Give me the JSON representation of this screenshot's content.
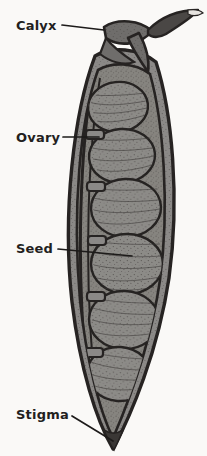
{
  "figure": {
    "background_color": "#faf9f7",
    "width": 207,
    "height": 456
  },
  "palette": {
    "background": "#faf9f7",
    "outline": "#262322",
    "tissue_mid": "#8b8987",
    "tissue_dark": "#6f6d6b",
    "tissue_light": "#a2a09e",
    "stipple": "#3b3836",
    "label_text": "#231f1e",
    "leader_line": "#1d1b1a"
  },
  "labels": [
    {
      "id": "calyx",
      "text": "Calyx",
      "text_x": 16,
      "text_y": 30,
      "leader": "M 62 25 L 104 30",
      "target_part": "calyx-sepals"
    },
    {
      "id": "ovary",
      "text": "Ovary",
      "text_x": 16,
      "text_y": 142,
      "leader": "M 63 137 L 99 137",
      "target_part": "ovary-wall"
    },
    {
      "id": "seed",
      "text": "Seed",
      "text_x": 16,
      "text_y": 253,
      "leader": "M 58 249 L 132 256",
      "target_part": "seed-body"
    },
    {
      "id": "stigma",
      "text": "Stigma",
      "text_x": 16,
      "text_y": 419,
      "leader": "M 72 416 L 113 441",
      "target_part": "stigma-tip"
    }
  ],
  "anatomy": {
    "pod_outline_label": "pod-outline",
    "pod_wall_label": "pod-wall",
    "cavity_label": "pod-cavity",
    "calyx_label": "calyx",
    "stigma_label": "stigma",
    "seed_count": 6,
    "funiculus_count": 5,
    "seeds": [
      {
        "index": 1,
        "cx": 118,
        "cy": 107,
        "rx": 30,
        "ry": 25,
        "rot": -6
      },
      {
        "index": 2,
        "cx": 122,
        "cy": 156,
        "rx": 33,
        "ry": 27,
        "rot": -4
      },
      {
        "index": 3,
        "cx": 126,
        "cy": 208,
        "rx": 35,
        "ry": 29,
        "rot": -2
      },
      {
        "index": 4,
        "cx": 127,
        "cy": 264,
        "rx": 36,
        "ry": 30,
        "rot": 0
      },
      {
        "index": 5,
        "cx": 124,
        "cy": 320,
        "rx": 35,
        "ry": 29,
        "rot": 2
      },
      {
        "index": 6,
        "cx": 119,
        "cy": 374,
        "rx": 32,
        "ry": 27,
        "rot": 4
      }
    ],
    "funiculi": [
      {
        "index": 1,
        "x": 88,
        "y": 130,
        "w": 16,
        "h": 9
      },
      {
        "index": 2,
        "x": 89,
        "y": 182,
        "w": 16,
        "h": 9
      },
      {
        "index": 3,
        "x": 90,
        "y": 236,
        "w": 16,
        "h": 9
      },
      {
        "index": 4,
        "x": 89,
        "y": 292,
        "w": 16,
        "h": 9
      },
      {
        "index": 5,
        "x": 87,
        "y": 348,
        "w": 16,
        "h": 9
      }
    ]
  }
}
